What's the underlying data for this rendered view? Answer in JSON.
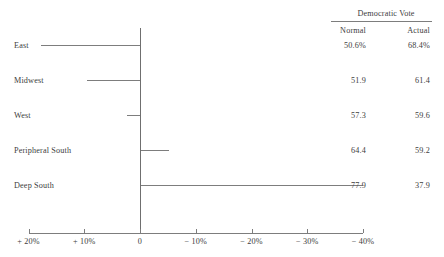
{
  "chart_data": {
    "type": "bar",
    "title": "",
    "subtitle": "",
    "orientation": "horizontal",
    "xlabel": "",
    "ylabel": "",
    "grid": false,
    "legend_position": "none",
    "categories": [
      "East",
      "Midwest",
      "West",
      "Peripheral South",
      "Deep South"
    ],
    "axis_ticks": [
      {
        "value": 20,
        "label": "+ 20%"
      },
      {
        "value": 10,
        "label": "+ 10%"
      },
      {
        "value": 0,
        "label": "0"
      },
      {
        "value": -10,
        "label": "− 10%"
      },
      {
        "value": -20,
        "label": "− 20%"
      },
      {
        "value": -30,
        "label": "− 30%"
      },
      {
        "value": -40,
        "label": "− 40%"
      }
    ],
    "xlim": [
      20,
      -40
    ],
    "axis_direction": "decreasing-left-to-right",
    "series": [
      {
        "name": "Change (Actual minus Normal)",
        "values": [
          17.8,
          9.5,
          2.3,
          -5.2,
          -40.0
        ]
      }
    ]
  },
  "table": {
    "header": "Democratic Vote",
    "columns": [
      "Normal",
      "Actual"
    ],
    "rows": [
      {
        "category": "East",
        "normal": "50.6%",
        "actual": "68.4%"
      },
      {
        "category": "Midwest",
        "normal": "51.9",
        "actual": "61.4"
      },
      {
        "category": "West",
        "normal": "57.3",
        "actual": "59.6"
      },
      {
        "category": "Peripheral South",
        "normal": "64.4",
        "actual": "59.2"
      },
      {
        "category": "Deep South",
        "normal": "77.9",
        "actual": "37.9"
      }
    ]
  },
  "labels": {
    "east": "East",
    "midwest": "Midwest",
    "west": "West",
    "peripheral_south": "Peripheral South",
    "deep_south": "Deep South"
  },
  "colors": {
    "ink": "#404040",
    "rule": "#7d7d7d",
    "background": "#ffffff"
  }
}
